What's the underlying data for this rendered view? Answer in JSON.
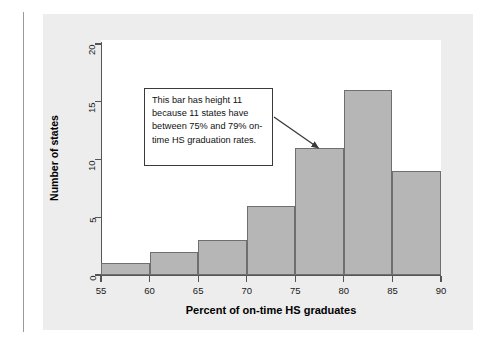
{
  "figure": {
    "annotation": {
      "text": "This bar has height 11 because 11 states have between 75% and 79% on-time HS graduation rates.",
      "points_to_bin": "75-80",
      "border_color": "#3a3a3a",
      "background_color": "#ffffff"
    },
    "panel_background": "#ededed",
    "plot_background": "#ffffff",
    "bar_fill": "#b6b6b6",
    "bar_stroke": "#6f6f6f",
    "axis_color": "#555555"
  },
  "chart_data": {
    "type": "bar",
    "title": "",
    "subtitle": "",
    "xlabel": "Percent of on-time HS graduates",
    "ylabel": "Number of states",
    "histogram": true,
    "bin_width": 5,
    "bin_edges": [
      55,
      60,
      65,
      70,
      75,
      80,
      85,
      90
    ],
    "categories": [
      "55-60",
      "60-65",
      "65-70",
      "70-75",
      "75-80",
      "80-85",
      "85-90"
    ],
    "values": [
      1,
      2,
      3,
      6,
      11,
      16,
      9
    ],
    "xlim": [
      55,
      90
    ],
    "ylim": [
      0,
      21
    ],
    "xticks": [
      55,
      60,
      65,
      70,
      75,
      80,
      85,
      90
    ],
    "xtick_labels": [
      "55",
      "60",
      "65",
      "70",
      "75",
      "80",
      "85",
      "90"
    ],
    "yticks": [
      0,
      5,
      10,
      15,
      20
    ],
    "ytick_labels": [
      "0",
      "5",
      "10",
      "15",
      "20"
    ],
    "grid": false,
    "legend": null,
    "annotations": [
      {
        "text": "This bar has height 11 because 11 states have between 75% and 79% on-time HS graduation rates.",
        "target_bin": "75-80",
        "target_value": 11
      }
    ]
  }
}
